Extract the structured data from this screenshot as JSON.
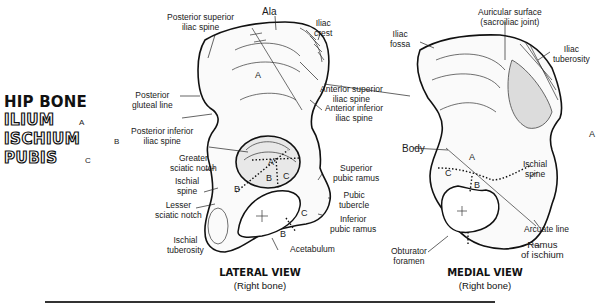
{
  "legend": {
    "title": "HIP BONE",
    "parts": [
      {
        "name": "ILIUM",
        "tag": "A"
      },
      {
        "name": "ISCHIUM",
        "tag": "B"
      },
      {
        "name": "PUBIS",
        "tag": "C"
      }
    ]
  },
  "lateral_view": {
    "title": "LATERAL VIEW",
    "subtitle": "(Right bone)",
    "labels": {
      "ala": "Ala",
      "iliac_crest": "Iliac\ncrest",
      "posterior_superior_iliac_spine": "Posterior superior\niliac spine",
      "posterior_gluteal_line": "Posterior\ngluteal line",
      "posterior_inferior_iliac_spine": "Posterior inferior\niliac spine",
      "greater_sciatic_notch": "Greater\nsciatic notch",
      "ischial_spine": "Ischial\nspine",
      "lesser_sciatic_notch": "Lesser\nsciatic notch",
      "ischial_tuberosity": "Ischial\ntuberosity",
      "acetabulum": "Acetabulum",
      "anterior_superior_iliac_spine": "Anterior superior\niliac spine",
      "anterior_inferior_iliac_spine": "Anterior inferior\niliac spine",
      "superior_pubic_ramus": "Superior\npubic ramus",
      "pubic_tubercle": "Pubic\ntubercle",
      "inferior_pubic_ramus": "Inferior\npubic ramus"
    },
    "region_letters": [
      "A",
      "A",
      "B",
      "C",
      "B",
      "C",
      "B"
    ]
  },
  "medial_view": {
    "title": "MEDIAL VIEW",
    "subtitle": "(Right bone)",
    "labels": {
      "iliac_fossa": "Iliac\nfossa",
      "auricular_surface": "Auricular surface\n(sacroiliac joint)",
      "iliac_tuberosity": "Iliac\ntuberosity",
      "body": "Body",
      "ischial_spine": "Ischial\nspine",
      "arcuate_line": "Arcuate line",
      "ramus_of_ischium": "Ramus\nof ischium",
      "obturator_foramen": "Obturator\nforamen"
    },
    "region_letters": [
      "A",
      "A",
      "C",
      "B"
    ]
  }
}
